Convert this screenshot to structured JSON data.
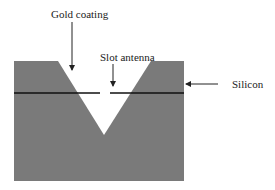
{
  "diagram": {
    "labels": {
      "gold_coating": "Gold coating",
      "slot_antenna": "Slot antenna",
      "silicon": "Silicon"
    },
    "colors": {
      "silicon_fill": "#7a7a7a",
      "groove_fill": "#ffffff",
      "line": "#111111",
      "arrow": "#222222"
    }
  }
}
